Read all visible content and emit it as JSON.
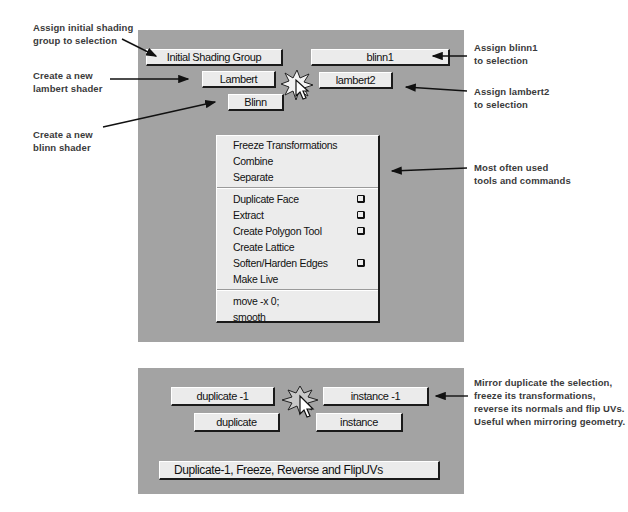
{
  "top_panel": {
    "buttons": {
      "initial_shading_group": "Initial Shading Group",
      "blinn1": "blinn1",
      "lambert": "Lambert",
      "lambert2": "lambert2",
      "blinn": "Blinn"
    },
    "marking_icon": "marking-menu-cursor-icon",
    "menu": {
      "groups": [
        [
          {
            "label": "Freeze Transformations",
            "option_box": false
          },
          {
            "label": "Combine",
            "option_box": false
          },
          {
            "label": "Separate",
            "option_box": false
          }
        ],
        [
          {
            "label": "Duplicate Face",
            "option_box": true
          },
          {
            "label": "Extract",
            "option_box": true
          },
          {
            "label": "Create Polygon Tool",
            "option_box": true
          },
          {
            "label": "Create Lattice",
            "option_box": false
          },
          {
            "label": "Soften/Harden Edges",
            "option_box": true
          },
          {
            "label": "Make Live",
            "option_box": false
          }
        ],
        [
          {
            "label": "move -x 0;",
            "option_box": false
          },
          {
            "label": "smooth",
            "option_box": false
          }
        ]
      ]
    }
  },
  "bottom_panel": {
    "buttons": {
      "duplicate_minus1": "duplicate -1",
      "instance_minus1": "instance -1",
      "duplicate": "duplicate",
      "instance": "instance",
      "mirror_combo": "Duplicate-1, Freeze, Reverse and FlipUVs"
    },
    "marking_icon": "marking-menu-cursor-icon"
  },
  "annotations": {
    "initial_shading": [
      "Assign initial shading",
      "group to selection"
    ],
    "new_lambert": [
      "Create a new",
      "lambert shader"
    ],
    "new_blinn": [
      "Create a new",
      "blinn shader"
    ],
    "assign_blinn1": [
      "Assign blinn1",
      "to selection"
    ],
    "assign_lambert2": [
      "Assign lambert2",
      "to selection"
    ],
    "most_used": [
      "Most often used",
      "tools and commands"
    ],
    "mirror": [
      "Mirror duplicate the selection,",
      "freeze its transformations,",
      "reverse its normals and flip UVs.",
      "Useful when mirroring geometry."
    ]
  },
  "colors": {
    "panel_bg": "#a3a3a3",
    "button_bg": "#ebebeb",
    "menu_bg": "#ececec",
    "annotation_text": "#3a3a3a"
  }
}
